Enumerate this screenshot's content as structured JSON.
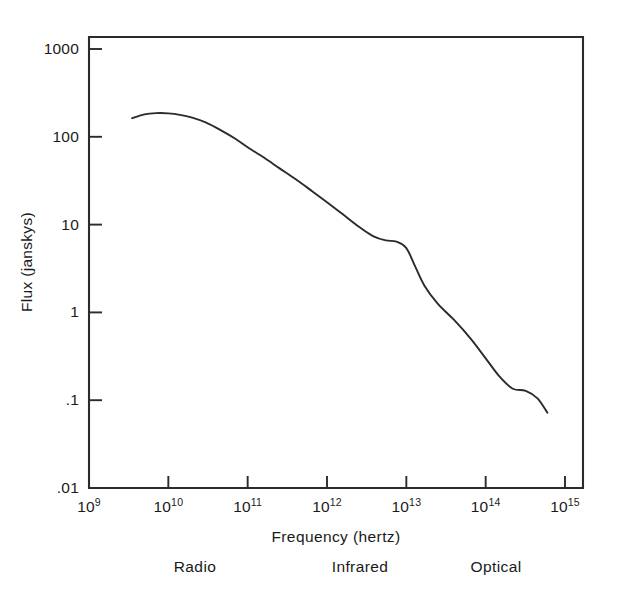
{
  "chart_data": {
    "type": "line",
    "title": "",
    "xlabel": "Frequency (hertz)",
    "ylabel": "Flux (janskys)",
    "xscale": "log",
    "yscale": "log",
    "xlim": [
      1000000000.0,
      1000000000000000.0
    ],
    "ylim": [
      0.01,
      1000
    ],
    "grid": false,
    "legend_position": "none",
    "x_tick_labels": [
      "10⁹",
      "10¹⁰",
      "10¹¹",
      "10¹²",
      "10¹³",
      "10¹⁴",
      "10¹⁵"
    ],
    "x_tick_mantissas": [
      "10",
      "10",
      "10",
      "10",
      "10",
      "10",
      "10"
    ],
    "x_tick_exponents": [
      "9",
      "10",
      "11",
      "12",
      "13",
      "14",
      "15"
    ],
    "x_tick_values": [
      1000000000.0,
      10000000000.0,
      100000000000.0,
      1000000000000.0,
      10000000000000.0,
      100000000000000.0,
      1000000000000000.0
    ],
    "y_tick_labels": [
      "1000",
      "100",
      "10",
      "1",
      ".1",
      ".01"
    ],
    "y_tick_values": [
      1000,
      100,
      10,
      1,
      0.1,
      0.01
    ],
    "series": [
      {
        "name": "spectrum",
        "color": "#2b2b2b",
        "x": [
          3500000000.0,
          5000000000.0,
          7000000000.0,
          10000000000.0,
          14000000000.0,
          20000000000.0,
          30000000000.0,
          45000000000.0,
          70000000000.0,
          100000000000.0,
          160000000000.0,
          250000000000.0,
          400000000000.0,
          650000000000.0,
          1000000000000.0,
          1600000000000.0,
          2500000000000.0,
          3800000000000.0,
          5500000000000.0,
          7500000000000.0,
          10000000000000.0,
          13000000000000.0,
          17000000000000.0,
          25000000000000.0,
          40000000000000.0,
          65000000000000.0,
          100000000000000.0,
          150000000000000.0,
          220000000000000.0,
          320000000000000.0,
          450000000000000.0,
          600000000000000.0
        ],
        "y": [
          163,
          180,
          186,
          185,
          178,
          165,
          145,
          120,
          95,
          76,
          58,
          44,
          33,
          24,
          18,
          13,
          9.5,
          7.4,
          6.6,
          6.4,
          5.4,
          3.3,
          2.0,
          1.25,
          0.82,
          0.5,
          0.3,
          0.185,
          0.135,
          0.128,
          0.105,
          0.072
        ]
      }
    ],
    "annotations": [
      {
        "label": "Radio",
        "x_center_px": 195
      },
      {
        "label": "Infrared",
        "x_center_px": 360
      },
      {
        "label": "Optical",
        "x_center_px": 496
      }
    ]
  },
  "axes": {
    "x_title": "Frequency (hertz)",
    "y_title": "Flux (janskys)"
  },
  "bands": {
    "radio": "Radio",
    "infrared": "Infrared",
    "optical": "Optical"
  },
  "ticks": {
    "y": [
      "1000",
      "100",
      "10",
      "1",
      ".1",
      ".01"
    ],
    "x": [
      {
        "mantissa": "10",
        "exp": "9"
      },
      {
        "mantissa": "10",
        "exp": "10"
      },
      {
        "mantissa": "10",
        "exp": "11"
      },
      {
        "mantissa": "10",
        "exp": "12"
      },
      {
        "mantissa": "10",
        "exp": "13"
      },
      {
        "mantissa": "10",
        "exp": "14"
      },
      {
        "mantissa": "10",
        "exp": "15"
      }
    ]
  },
  "colors": {
    "curve": "#2b2b2b",
    "axis": "#2b2b2b",
    "text": "#1a1a1a",
    "background": "#ffffff"
  }
}
